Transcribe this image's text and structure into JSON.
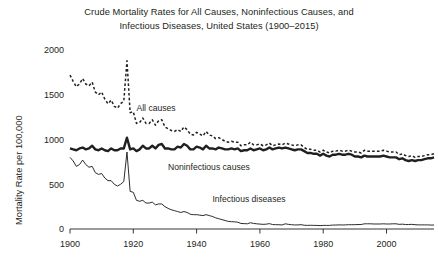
{
  "chart_data": {
    "type": "line",
    "title": "Crude Mortality Rates for All Causes, Noninfectious Causes, and Infectious Diseases, United States (1900–2015)",
    "title_line1": "Crude Mortality Rates for All Causes, Noninfectious Causes, and",
    "title_line2": "Infectious Diseases, United States (1900–2015)",
    "xlabel": "",
    "ylabel": "Mortality Rate per 100,000",
    "xlim": [
      1900,
      2015
    ],
    "ylim": [
      0,
      2000
    ],
    "xticks": [
      1900,
      1920,
      1940,
      1960,
      1980,
      2000
    ],
    "yticks": [
      0,
      500,
      1000,
      1500,
      2000
    ],
    "xtick_labels": [
      "1900",
      "1920",
      "1940",
      "1960",
      "1980",
      "2000"
    ],
    "ytick_labels": [
      "0",
      "500",
      "1000",
      "1500",
      "2000"
    ],
    "grid": false,
    "legend_position": "inline-annotations",
    "line_color": "#231f20",
    "x": [
      1900,
      1901,
      1902,
      1903,
      1904,
      1905,
      1906,
      1907,
      1908,
      1909,
      1910,
      1911,
      1912,
      1913,
      1914,
      1915,
      1916,
      1917,
      1918,
      1919,
      1920,
      1921,
      1922,
      1923,
      1924,
      1925,
      1926,
      1927,
      1928,
      1929,
      1930,
      1931,
      1932,
      1933,
      1934,
      1935,
      1936,
      1937,
      1938,
      1939,
      1940,
      1941,
      1942,
      1943,
      1944,
      1945,
      1946,
      1947,
      1948,
      1949,
      1950,
      1951,
      1952,
      1953,
      1954,
      1955,
      1956,
      1957,
      1958,
      1959,
      1960,
      1961,
      1962,
      1963,
      1964,
      1965,
      1966,
      1967,
      1968,
      1969,
      1970,
      1971,
      1972,
      1973,
      1974,
      1975,
      1976,
      1977,
      1978,
      1979,
      1980,
      1981,
      1982,
      1983,
      1984,
      1985,
      1986,
      1987,
      1988,
      1989,
      1990,
      1991,
      1992,
      1993,
      1994,
      1995,
      1996,
      1997,
      1998,
      1999,
      2000,
      2001,
      2002,
      2003,
      2004,
      2005,
      2006,
      2007,
      2008,
      2009,
      2010,
      2011,
      2012,
      2013,
      2014,
      2015
    ],
    "series": [
      {
        "name": "All causes",
        "style": "dashed",
        "label": "All causes",
        "label_x": 1921,
        "label_y": 1320,
        "values": [
          1720,
          1650,
          1590,
          1620,
          1680,
          1620,
          1600,
          1640,
          1530,
          1500,
          1530,
          1450,
          1400,
          1440,
          1370,
          1350,
          1400,
          1430,
          1880,
          1300,
          1310,
          1180,
          1190,
          1240,
          1180,
          1180,
          1220,
          1160,
          1210,
          1220,
          1140,
          1120,
          1100,
          1090,
          1110,
          1090,
          1140,
          1110,
          1060,
          1050,
          1080,
          1060,
          1040,
          1090,
          1050,
          1040,
          1010,
          1020,
          1000,
          980,
          970,
          980,
          970,
          970,
          930,
          940,
          940,
          970,
          940,
          940,
          950,
          930,
          940,
          960,
          930,
          940,
          950,
          940,
          960,
          950,
          940,
          930,
          940,
          940,
          910,
          890,
          890,
          880,
          880,
          860,
          880,
          860,
          850,
          870,
          870,
          880,
          870,
          870,
          880,
          870,
          860,
          860,
          850,
          880,
          870,
          870,
          870,
          870,
          870,
          880,
          870,
          860,
          860,
          860,
          830,
          840,
          820,
          810,
          820,
          800,
          810,
          810,
          820,
          830,
          830,
          840
        ]
      },
      {
        "name": "Noninfectious causes",
        "style": "solid-thick",
        "label": "Noninfectious causes",
        "label_x": 1931,
        "label_y": 660,
        "values": [
          900,
          890,
          880,
          900,
          910,
          890,
          900,
          930,
          890,
          880,
          900,
          880,
          870,
          900,
          880,
          880,
          900,
          900,
          1020,
          890,
          900,
          870,
          890,
          930,
          900,
          900,
          930,
          900,
          940,
          950,
          900,
          900,
          890,
          890,
          920,
          910,
          950,
          930,
          890,
          890,
          920,
          910,
          890,
          930,
          900,
          900,
          890,
          910,
          900,
          890,
          890,
          900,
          890,
          900,
          870,
          880,
          880,
          900,
          880,
          890,
          900,
          880,
          890,
          910,
          890,
          900,
          910,
          900,
          910,
          900,
          890,
          880,
          890,
          890,
          870,
          850,
          850,
          840,
          840,
          820,
          840,
          820,
          810,
          830,
          830,
          840,
          830,
          830,
          840,
          830,
          810,
          810,
          800,
          820,
          810,
          810,
          810,
          810,
          810,
          820,
          810,
          800,
          800,
          800,
          780,
          790,
          770,
          760,
          770,
          760,
          770,
          770,
          780,
          790,
          790,
          800
        ]
      },
      {
        "name": "Infectious diseases",
        "style": "solid-thin",
        "label": "Infectious diseases",
        "label_x": 1945,
        "label_y": 300,
        "values": [
          800,
          760,
          700,
          720,
          770,
          720,
          690,
          700,
          630,
          610,
          620,
          570,
          540,
          540,
          500,
          480,
          500,
          530,
          860,
          420,
          410,
          320,
          310,
          320,
          290,
          290,
          300,
          270,
          280,
          280,
          250,
          230,
          215,
          205,
          195,
          185,
          195,
          185,
          165,
          160,
          160,
          155,
          150,
          160,
          150,
          140,
          125,
          115,
          105,
          95,
          85,
          82,
          80,
          76,
          62,
          60,
          58,
          70,
          62,
          58,
          55,
          52,
          54,
          60,
          50,
          48,
          48,
          45,
          58,
          52,
          48,
          45,
          46,
          48,
          42,
          40,
          42,
          40,
          40,
          38,
          40,
          40,
          40,
          44,
          44,
          46,
          45,
          46,
          48,
          48,
          48,
          50,
          50,
          58,
          58,
          58,
          56,
          56,
          56,
          58,
          56,
          56,
          58,
          58,
          52,
          54,
          50,
          50,
          52,
          48,
          46,
          46,
          46,
          46,
          44,
          44
        ]
      }
    ]
  },
  "axis": {
    "y_title": "Mortality Rate per 100,000"
  }
}
